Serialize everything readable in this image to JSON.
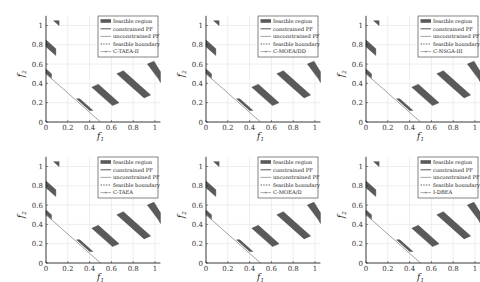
{
  "figure": {
    "layout": {
      "rows": 2,
      "cols": 3
    },
    "colors": {
      "feasible_region": "#5a5a5a",
      "constrained_pf": "#444444",
      "unconstrained_pf": "#9a9a9a",
      "feasible_boundary": "#555555",
      "algorithm_points": "#888888",
      "grid": "#e2e2e2",
      "axis": "#222222"
    }
  },
  "chart_data": [
    {
      "type": "scatter",
      "title": "",
      "xlabel": "f1",
      "ylabel": "f2",
      "xlim": [
        0,
        1.05
      ],
      "ylim": [
        0,
        1.1
      ],
      "xticks": [
        "0",
        "0.2",
        "0.4",
        "0.6",
        "0.8",
        "1"
      ],
      "yticks": [
        "0",
        "0.2",
        "0.4",
        "0.6",
        "0.8",
        "1"
      ],
      "grid": true,
      "legend_position": "upper right",
      "legend": [
        "feasible region",
        "constrained PF",
        "unconstrained PF",
        "feasible boundary",
        "C-TAEA-II"
      ],
      "algorithm": "C-TAEA-II"
    },
    {
      "type": "scatter",
      "title": "",
      "xlabel": "f1",
      "ylabel": "f2",
      "xlim": [
        0,
        1.05
      ],
      "ylim": [
        0,
        1.1
      ],
      "xticks": [
        "0",
        "0.2",
        "0.4",
        "0.6",
        "0.8",
        "1"
      ],
      "yticks": [
        "0",
        "0.2",
        "0.4",
        "0.6",
        "0.8",
        "1"
      ],
      "grid": true,
      "legend_position": "upper right",
      "legend": [
        "feasible region",
        "constrained PF",
        "unconstrained PF",
        "feasible boundary",
        "C-MOEA/DD"
      ],
      "algorithm": "C-MOEA/DD"
    },
    {
      "type": "scatter",
      "title": "",
      "xlabel": "f1",
      "ylabel": "f2",
      "xlim": [
        0,
        1.05
      ],
      "ylim": [
        0,
        1.1
      ],
      "xticks": [
        "0",
        "0.2",
        "0.4",
        "0.6",
        "0.8",
        "1"
      ],
      "yticks": [
        "0",
        "0.2",
        "0.4",
        "0.6",
        "0.8",
        "1"
      ],
      "grid": true,
      "legend_position": "upper right",
      "legend": [
        "feasible region",
        "constrained PF",
        "unconstrained PF",
        "feasible boundary",
        "C-NSGA-III"
      ],
      "algorithm": "C-NSGA-III"
    },
    {
      "type": "scatter",
      "title": "",
      "xlabel": "f1",
      "ylabel": "f2",
      "xlim": [
        0,
        1.05
      ],
      "ylim": [
        0,
        1.1
      ],
      "xticks": [
        "0",
        "0.2",
        "0.4",
        "0.6",
        "0.8",
        "1"
      ],
      "yticks": [
        "0",
        "0.2",
        "0.4",
        "0.6",
        "0.8",
        "1"
      ],
      "grid": true,
      "legend_position": "upper right",
      "legend": [
        "feasible region",
        "constrained PF",
        "unconstrained PF",
        "feasible boundary",
        "C-TAEA"
      ],
      "algorithm": "C-TAEA"
    },
    {
      "type": "scatter",
      "title": "",
      "xlabel": "f1",
      "ylabel": "f2",
      "xlim": [
        0,
        1.05
      ],
      "ylim": [
        0,
        1.1
      ],
      "xticks": [
        "0",
        "0.2",
        "0.4",
        "0.6",
        "0.8",
        "1"
      ],
      "yticks": [
        "0",
        "0.2",
        "0.4",
        "0.6",
        "0.8",
        "1"
      ],
      "grid": true,
      "legend_position": "upper right",
      "legend": [
        "feasible region",
        "constrained PF",
        "unconstrained PF",
        "feasible boundary",
        "C-MOEA/D"
      ],
      "algorithm": "C-MOEA/D"
    },
    {
      "type": "scatter",
      "title": "",
      "xlabel": "f1",
      "ylabel": "f2",
      "xlim": [
        0,
        1.05
      ],
      "ylim": [
        0,
        1.1
      ],
      "xticks": [
        "0",
        "0.2",
        "0.4",
        "0.6",
        "0.8",
        "1"
      ],
      "yticks": [
        "0",
        "0.2",
        "0.4",
        "0.6",
        "0.8",
        "1"
      ],
      "grid": true,
      "legend_position": "upper right",
      "legend": [
        "feasible region",
        "constrained PF",
        "unconstrained PF",
        "feasible boundary",
        "I-DBEA"
      ],
      "algorithm": "I-DBEA"
    }
  ],
  "shared_geometry": {
    "unconstrained_pf": [
      [
        0,
        0.5
      ],
      [
        0.5,
        0
      ]
    ],
    "feasible_regions": [
      [
        [
          0.07,
          1.05
        ],
        [
          0.12,
          1.05
        ],
        [
          0.12,
          1.0
        ]
      ],
      [
        [
          0.0,
          0.85
        ],
        [
          0.0,
          0.78
        ],
        [
          0.09,
          0.69
        ],
        [
          0.09,
          0.76
        ]
      ],
      [
        [
          0.0,
          0.55
        ],
        [
          0.0,
          0.5
        ],
        [
          0.05,
          0.45
        ],
        [
          0.05,
          0.5
        ]
      ],
      [
        [
          0.28,
          0.24
        ],
        [
          0.31,
          0.24
        ],
        [
          0.43,
          0.12
        ],
        [
          0.4,
          0.12
        ]
      ],
      [
        [
          0.42,
          0.36
        ],
        [
          0.48,
          0.39
        ],
        [
          0.67,
          0.2
        ],
        [
          0.61,
          0.17
        ]
      ],
      [
        [
          0.65,
          0.5
        ],
        [
          0.71,
          0.53
        ],
        [
          0.96,
          0.28
        ],
        [
          0.9,
          0.25
        ]
      ],
      [
        [
          0.93,
          0.6
        ],
        [
          0.99,
          0.63
        ],
        [
          1.05,
          0.52
        ],
        [
          1.05,
          0.41
        ],
        [
          1.03,
          0.45
        ]
      ]
    ]
  }
}
